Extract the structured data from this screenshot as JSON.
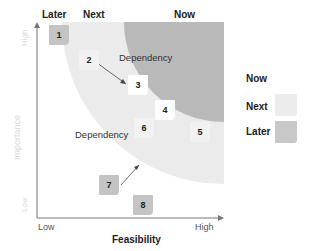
{
  "columns": {
    "later": "Later",
    "next": "Next",
    "now": "Now"
  },
  "axes": {
    "y_title": "Importance",
    "y_high": "High",
    "y_low": "Low",
    "x_title": "Feasibility",
    "x_low": "Low",
    "x_high": "High"
  },
  "dependencies": {
    "upper": "Dependency",
    "lower": "Dependency"
  },
  "items": [
    {
      "label": "1",
      "zone": "Later"
    },
    {
      "label": "2",
      "zone": "Next"
    },
    {
      "label": "3",
      "zone": "Now"
    },
    {
      "label": "4",
      "zone": "Now"
    },
    {
      "label": "5",
      "zone": "Next"
    },
    {
      "label": "6",
      "zone": "Next"
    },
    {
      "label": "7",
      "zone": "Later"
    },
    {
      "label": "8",
      "zone": "Later"
    }
  ],
  "legend": [
    {
      "label": "Now",
      "color": "#ffffff"
    },
    {
      "label": "Next",
      "color": "#ececec"
    },
    {
      "label": "Later",
      "color": "#c8c8c8"
    }
  ],
  "colors": {
    "now_region": "#b9b9b9",
    "next_region": "#ebebeb",
    "later_region": "#ffffff",
    "box_now": "#ffffff",
    "box_next": "#f2f2f2",
    "box_later": "#c4c4c4"
  }
}
